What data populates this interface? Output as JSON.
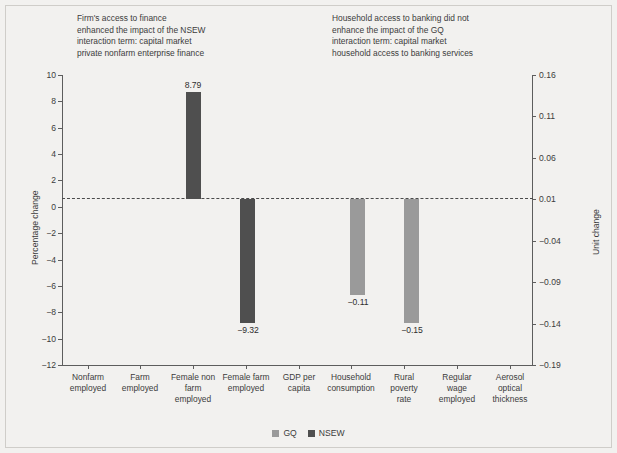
{
  "annotations": {
    "left": "Firm's access to finance\nenhanced the impact of the NSEW\ninteraction term: capital market\nprivate nonfarm enterprise finance",
    "right": "Household access to banking did not\nenhance the impact of the GQ\ninteraction term: capital market\nhousehold access to banking services"
  },
  "legend": [
    {
      "label": "GQ",
      "color": "#9a9a9a"
    },
    {
      "label": "NSEW",
      "color": "#4f4f4f"
    }
  ],
  "chart_data": {
    "type": "bar",
    "title": "",
    "xlabel": "",
    "ylabel": "Percentage change",
    "ylabel_secondary": "Unit change",
    "categories": [
      "Nonfarm\nemployed",
      "Farm\nemployed",
      "Female non\nfarm\nemployed",
      "Female farm\nemployed",
      "GDP per\ncapita",
      "Household\nconsumption",
      "Rural\npoverty\nrate",
      "Regular\nwage\nemployed",
      "Aerosol\noptical\nthickness"
    ],
    "ylim": [
      -12,
      10
    ],
    "yticks": [
      10,
      8,
      6,
      4,
      2,
      0,
      -2,
      -4,
      -6,
      -8,
      -10,
      -12
    ],
    "ytick_labels": [
      "10",
      "8",
      "6",
      "4",
      "2",
      "0",
      "-2",
      "-4",
      "-6",
      "-8",
      "-10",
      "-12"
    ],
    "ylim_secondary": [
      -0.19,
      0.16
    ],
    "yticks_secondary": [
      0.16,
      0.11,
      0.06,
      0.01,
      -0.04,
      -0.09,
      -0.14,
      -0.19
    ],
    "ytick_labels_secondary": [
      "0.16",
      "0.11",
      "0.06",
      "0.01",
      "-0.04",
      "-0.09",
      "-0.14",
      "-0.19"
    ],
    "grid": false,
    "zero_line": true,
    "legend_position": "bottom",
    "series": [
      {
        "name": "GQ",
        "color": "#9a9a9a",
        "axis": "secondary",
        "values": [
          null,
          null,
          null,
          null,
          null,
          -0.11,
          -0.15,
          null,
          null
        ],
        "labels": [
          null,
          null,
          null,
          null,
          null,
          "-0.11",
          "-0.15",
          null,
          null
        ]
      },
      {
        "name": "NSEW",
        "color": "#4f4f4f",
        "axis": "primary",
        "values": [
          null,
          null,
          8.79,
          -9.32,
          null,
          null,
          null,
          null,
          null
        ],
        "labels": [
          null,
          null,
          "8.79",
          "-9.32",
          null,
          null,
          null,
          null,
          null
        ]
      }
    ],
    "bars": [
      {
        "category": "Female non farm employed",
        "series": "NSEW",
        "value": 8.79,
        "label": "8.79",
        "color": "#4f4f4f",
        "x": 186,
        "w": 15,
        "y": 92,
        "h": 107,
        "label_x": 193,
        "label_y": 80
      },
      {
        "category": "Female farm employed",
        "series": "NSEW",
        "value": -9.32,
        "label": "-9.32",
        "color": "#4f4f4f",
        "x": 240,
        "w": 15,
        "y": 199,
        "h": 124,
        "label_x": 248,
        "label_y": 325
      },
      {
        "category": "Household consumption",
        "series": "GQ",
        "value": -0.11,
        "label": "-0.11",
        "color": "#9a9a9a",
        "x": 350,
        "w": 15,
        "y": 199,
        "h": 96,
        "label_x": 358,
        "label_y": 297
      },
      {
        "category": "Rural poverty rate",
        "series": "GQ",
        "value": -0.15,
        "label": "-0.15",
        "color": "#9a9a9a",
        "x": 404,
        "w": 15,
        "y": 199,
        "h": 124,
        "label_x": 412,
        "label_y": 325
      }
    ],
    "category_tick_x": [
      88,
      140,
      193,
      246,
      299,
      351,
      404,
      457,
      510
    ]
  }
}
